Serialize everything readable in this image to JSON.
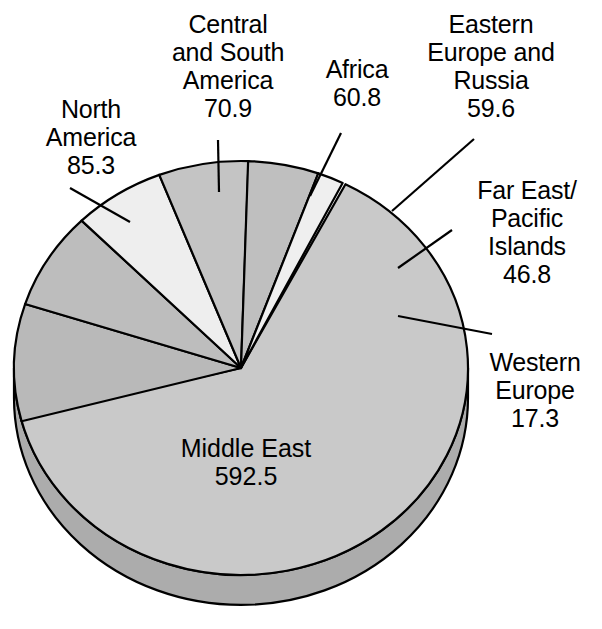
{
  "chart_data": {
    "type": "pie",
    "title": "",
    "subtitle": "",
    "xlabel": "",
    "ylabel": "",
    "legend_position": "callout-labels",
    "grid": false,
    "units": "billion barrels",
    "total": 933.2,
    "categories": [
      "Middle East",
      "North America",
      "Central and South America",
      "Africa",
      "Eastern Europe and Russia",
      "Far East/Pacific Islands",
      "Western Europe"
    ],
    "values": [
      592.5,
      85.3,
      70.9,
      60.8,
      59.6,
      46.8,
      17.3
    ],
    "slices": [
      {
        "id": "middle-east",
        "label": "Middle East",
        "value": 592.5,
        "value_text": "592.5",
        "label_text": "Middle East\n592.5",
        "fill": "#c9c9c9",
        "start_deg": 194.0,
        "sweep_deg": 228.6,
        "label_placement": "inside"
      },
      {
        "id": "north-america",
        "label": "North America",
        "value": 85.3,
        "value_text": "85.3",
        "label_text": "North\nAmerica\n85.3",
        "fill": "#b9b9b9",
        "start_deg": 162.0,
        "sweep_deg": 32.9,
        "label_placement": "callout"
      },
      {
        "id": "central-and-south-america",
        "label": "Central and South America",
        "value": 70.9,
        "value_text": "70.9",
        "label_text": "Central\nand South\nAmerica\n70.9",
        "fill": "#bdbdbd",
        "start_deg": 134.6,
        "sweep_deg": 27.4,
        "label_placement": "callout"
      },
      {
        "id": "africa",
        "label": "Africa",
        "value": 60.8,
        "value_text": "60.8",
        "label_text": "Africa\n60.8",
        "fill": "#eeeeee",
        "start_deg": 111.1,
        "sweep_deg": 23.5,
        "label_placement": "callout"
      },
      {
        "id": "eastern-europe-and-russia",
        "label": "Eastern Europe and Russia",
        "value": 59.6,
        "value_text": "59.6",
        "label_text": "Eastern\nEurope and\nRussia\n59.6",
        "fill": "#c4c4c4",
        "start_deg": 88.1,
        "sweep_deg": 23.0,
        "label_placement": "callout"
      },
      {
        "id": "far-east-pacific-islands",
        "label": "Far East/Pacific Islands",
        "value": 46.8,
        "value_text": "46.8",
        "label_text": "Far East/\nPacific\nIslands\n46.8",
        "fill": "#bfbfbf",
        "start_deg": 70.1,
        "sweep_deg": 18.1,
        "label_placement": "callout"
      },
      {
        "id": "western-europe",
        "label": "Western Europe",
        "value": 17.3,
        "value_text": "17.3",
        "label_text": "Western\nEurope\n17.3",
        "fill": "#efefef",
        "start_deg": 63.4,
        "sweep_deg": 6.7,
        "label_placement": "callout"
      }
    ],
    "style": {
      "effect": "3d-extruded-pie",
      "outline_color": "#000000",
      "side_fill": "#acacac",
      "background": "#ffffff",
      "center_x": 241,
      "center_y": 368,
      "radius_x": 227,
      "radius_y": 207,
      "depth": 30
    }
  }
}
